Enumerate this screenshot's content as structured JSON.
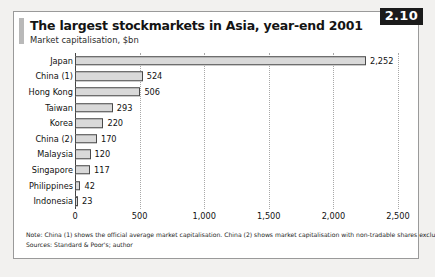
{
  "badge": {
    "label": "2.10"
  },
  "header": {
    "title": "The largest stockmarkets in Asia, year-end 2001",
    "subtitle": "Market capitalisation, $bn"
  },
  "notes": {
    "note": "Note: China (1) shows the official average market capitalisation. China (2) shows market capitalisation with non-tradable shares excluded.",
    "sources": "Sources: Standard & Poor's; author"
  },
  "chart_data": {
    "type": "bar",
    "orientation": "horizontal",
    "title": "The largest stockmarkets in Asia, year-end 2001",
    "subtitle": "Market capitalisation, $bn",
    "xlabel": "",
    "ylabel": "",
    "xlim": [
      0,
      2500
    ],
    "xticks": [
      0,
      500,
      1000,
      1500,
      2000,
      2500
    ],
    "xticklabels": [
      "0",
      "500",
      "1,000",
      "1,500",
      "2,000",
      "2,500"
    ],
    "grid": true,
    "legend": false,
    "bar_color": "#d9d9d9",
    "bar_border_color": "#4a4a4a",
    "categories": [
      "Japan",
      "China (1)",
      "Hong Kong",
      "Taiwan",
      "Korea",
      "China (2)",
      "Malaysia",
      "Singapore",
      "Philippines",
      "Indonesia"
    ],
    "values": [
      2252,
      524,
      506,
      293,
      220,
      170,
      120,
      117,
      42,
      23
    ],
    "value_labels": [
      "2,252",
      "524",
      "506",
      "293",
      "220",
      "170",
      "120",
      "117",
      "42",
      "23"
    ]
  }
}
